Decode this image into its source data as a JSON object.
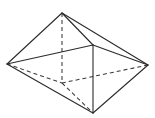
{
  "figure": {
    "kind": "geometric-wireframe",
    "width": 155,
    "height": 118,
    "background_color": "#ffffff",
    "solid_edge_color": "#2b2b2b",
    "hidden_edge_color": "#3a3a3a",
    "solid_stroke_width": 1.1,
    "hidden_stroke_width": 1.05,
    "hidden_dash_pattern": "4 3",
    "vertices": {
      "top_apex": {
        "x": 62,
        "y": 13
      },
      "left": {
        "x": 7,
        "y": 64
      },
      "right": {
        "x": 148,
        "y": 65
      },
      "bottom_apex": {
        "x": 93,
        "y": 113
      },
      "base_front_right": {
        "x": 93,
        "y": 45
      },
      "base_back": {
        "x": 62,
        "y": 83
      }
    },
    "edges_solid": [
      {
        "name": "apex-to-left",
        "from": "top_apex",
        "to": "left"
      },
      {
        "name": "apex-to-right",
        "from": "top_apex",
        "to": "right"
      },
      {
        "name": "apex-to-base-front-right",
        "from": "top_apex",
        "to": "base_front_right"
      },
      {
        "name": "left-to-base-front-right",
        "from": "left",
        "to": "base_front_right"
      },
      {
        "name": "right-to-base-front-right",
        "from": "right",
        "to": "base_front_right"
      },
      {
        "name": "left-to-bottom-apex",
        "from": "left",
        "to": "bottom_apex"
      },
      {
        "name": "right-to-bottom-apex",
        "from": "right",
        "to": "bottom_apex"
      },
      {
        "name": "base-front-right-to-bottom-apex",
        "from": "base_front_right",
        "to": "bottom_apex"
      }
    ],
    "edges_dashed": [
      {
        "name": "apex-to-base-back",
        "from": "top_apex",
        "to": "base_back"
      },
      {
        "name": "left-to-base-back",
        "from": "left",
        "to": "base_back"
      },
      {
        "name": "right-to-base-back",
        "from": "right",
        "to": "base_back"
      },
      {
        "name": "base-back-to-bottom-apex",
        "from": "base_back",
        "to": "bottom_apex"
      }
    ],
    "labels": []
  }
}
